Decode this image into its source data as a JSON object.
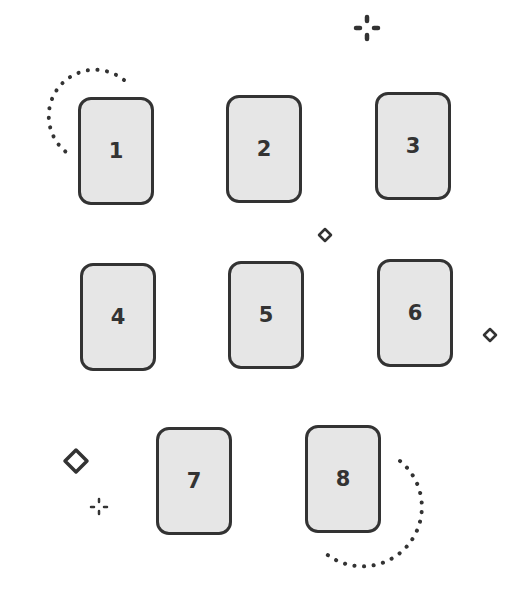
{
  "diagram": {
    "colors": {
      "card_fill": "#e6e6e6",
      "card_stroke": "#333333",
      "background": "#ffffff"
    },
    "cards": [
      {
        "label": "1",
        "x": 78,
        "y": 97
      },
      {
        "label": "2",
        "x": 226,
        "y": 95
      },
      {
        "label": "3",
        "x": 375,
        "y": 92
      },
      {
        "label": "4",
        "x": 80,
        "y": 263
      },
      {
        "label": "5",
        "x": 228,
        "y": 261
      },
      {
        "label": "6",
        "x": 377,
        "y": 259
      },
      {
        "label": "7",
        "x": 156,
        "y": 427
      },
      {
        "label": "8",
        "x": 305,
        "y": 425
      }
    ],
    "decorations": [
      "dotted-arc-top-left",
      "sparkle-top-right",
      "small-diamond-center",
      "small-diamond-right",
      "large-diamond-bottom-left",
      "sparkle-bottom-left",
      "dotted-arc-bottom-right"
    ]
  }
}
